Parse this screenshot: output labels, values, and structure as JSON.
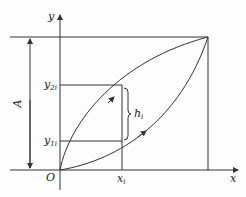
{
  "diagram": {
    "axis_labels": {
      "x": "x",
      "y": "y",
      "origin": "O"
    },
    "labels": {
      "y2": {
        "base": "y",
        "sub": "2i"
      },
      "y1": {
        "base": "y",
        "sub": "1i"
      },
      "xi": {
        "base": "x",
        "sub": "i"
      },
      "hi": {
        "base": "h",
        "sub": "i"
      },
      "A": "A"
    },
    "colors": {
      "line": "#333333",
      "background": "#fdfdfd"
    }
  }
}
